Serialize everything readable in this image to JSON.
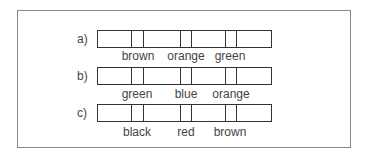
{
  "figure": {
    "rows": [
      {
        "label": "a)",
        "bands": [
          "brown",
          "orange",
          "green"
        ]
      },
      {
        "label": "b)",
        "bands": [
          "green",
          "blue",
          "orange"
        ]
      },
      {
        "label": "c)",
        "bands": [
          "black",
          "red",
          "brown"
        ]
      }
    ]
  }
}
